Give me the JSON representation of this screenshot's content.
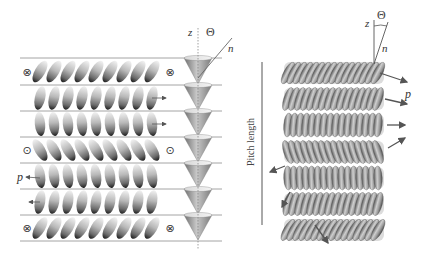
{
  "left_panel": {
    "axis_labels": {
      "z": "z",
      "theta": "Θ",
      "n": "n",
      "p": "p"
    },
    "layer_lines_y": [
      58,
      85,
      111,
      137,
      163,
      189,
      215,
      241
    ],
    "line_x": [
      20,
      222
    ],
    "rows": [
      {
        "tilt": 30,
        "symbol": "⊗",
        "symbol_name": "into-page-symbol",
        "arrow": null
      },
      {
        "tilt": 12,
        "symbol": null,
        "arrow": "right"
      },
      {
        "tilt": -5,
        "symbol": null,
        "arrow": "right-short"
      },
      {
        "tilt": -30,
        "symbol": "⊙",
        "symbol_name": "out-of-page-symbol",
        "arrow": null
      },
      {
        "tilt": -8,
        "symbol": null,
        "arrow": "left-p"
      },
      {
        "tilt": 10,
        "symbol": null,
        "arrow": "left"
      },
      {
        "tilt": 30,
        "symbol": "⊗",
        "symbol_name": "into-page-symbol",
        "arrow": null
      }
    ],
    "molecules_per_row": 9,
    "cone_x": 198
  },
  "right_panel": {
    "axis_labels": {
      "z": "z",
      "theta": "Θ",
      "n": "n",
      "p": "p"
    },
    "pitch_label": "Pitch length",
    "layers": [
      {
        "y": 73,
        "tilt": 28,
        "arrow": {
          "x1": 380,
          "y1": 73,
          "x2": 407,
          "y2": 82
        }
      },
      {
        "y": 99,
        "tilt": 18,
        "arrow": {
          "x1": 385,
          "y1": 99,
          "x2": 407,
          "y2": 104
        }
      },
      {
        "y": 125,
        "tilt": 5,
        "arrow": {
          "x1": 387,
          "y1": 125,
          "x2": 405,
          "y2": 125
        }
      },
      {
        "y": 152,
        "tilt": -18,
        "arrow": {
          "x1": 388,
          "y1": 148,
          "x2": 405,
          "y2": 138
        }
      },
      {
        "y": 178,
        "tilt": -2,
        "arrow": {
          "x1": 285,
          "y1": 166,
          "x2": 270,
          "y2": 172
        }
      },
      {
        "y": 204,
        "tilt": 15,
        "arrow": {
          "x1": 290,
          "y1": 192,
          "x2": 282,
          "y2": 207
        }
      },
      {
        "y": 230,
        "tilt": 30,
        "arrow": {
          "x1": 315,
          "y1": 225,
          "x2": 328,
          "y2": 243
        }
      }
    ]
  },
  "colors": {
    "line": "#9a9a9a",
    "molecule_light": "#e0e0e0",
    "molecule_dark": "#2a2a2a",
    "cone": "#8a8a8a",
    "arrow": "#555555"
  }
}
